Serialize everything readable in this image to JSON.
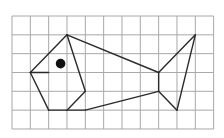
{
  "diagram": {
    "type": "grid-drawing",
    "grid": {
      "columns": 11,
      "rows": 6,
      "origin_px": [
        12,
        16
      ],
      "cell_w": 18.33,
      "cell_h": 18.83,
      "line_color": "#a8a8a8"
    },
    "stroke_color": "#2a2a2a",
    "segments": [
      [
        [
          3,
          1
        ],
        [
          1,
          3
        ]
      ],
      [
        [
          1,
          3
        ],
        [
          2,
          5
        ]
      ],
      [
        [
          2,
          5
        ],
        [
          4,
          5
        ]
      ],
      [
        [
          1,
          3
        ],
        [
          2,
          3
        ]
      ],
      [
        [
          3,
          1
        ],
        [
          4,
          4
        ]
      ],
      [
        [
          4,
          4
        ],
        [
          3,
          5
        ]
      ],
      [
        [
          3,
          1
        ],
        [
          8,
          3
        ]
      ],
      [
        [
          8,
          3
        ],
        [
          8,
          4
        ]
      ],
      [
        [
          4,
          5
        ],
        [
          8,
          4
        ]
      ],
      [
        [
          8,
          3
        ],
        [
          10,
          1
        ]
      ],
      [
        [
          10,
          1
        ],
        [
          9,
          5
        ]
      ],
      [
        [
          9,
          5
        ],
        [
          8,
          4
        ]
      ]
    ],
    "eye": {
      "center": [
        2.65,
        2.53
      ],
      "radius": 4.8,
      "color": "#111111"
    }
  }
}
